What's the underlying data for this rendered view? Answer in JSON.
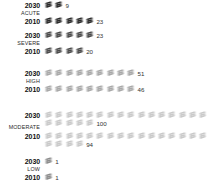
{
  "chart_data": {
    "type": "bar",
    "subtype": "pictogram",
    "title": "",
    "xlabel": "",
    "ylabel": "",
    "icon_unit": 6,
    "icon_name": "document-stack-icon",
    "categories": [
      "ACUTE",
      "SEVERE",
      "HIGH",
      "MODERATE",
      "LOW"
    ],
    "series": [
      {
        "name": "2030",
        "values": [
          9,
          23,
          51,
          100,
          1
        ]
      },
      {
        "name": "2010",
        "values": [
          23,
          20,
          46,
          94,
          1
        ]
      }
    ],
    "groups": [
      {
        "category": "ACUTE",
        "color": "#2b2b2b",
        "rows": [
          {
            "year": "2030",
            "value": 9,
            "icons": 2
          },
          {
            "year": "2010",
            "value": 23,
            "icons": 5
          }
        ]
      },
      {
        "category": "SEVERE",
        "color": "#4a4a4a",
        "rows": [
          {
            "year": "2030",
            "value": 23,
            "icons": 5
          },
          {
            "year": "2010",
            "value": 20,
            "icons": 4
          }
        ]
      },
      {
        "category": "HIGH",
        "color": "#a8a8a8",
        "rows": [
          {
            "year": "2030",
            "value": 51,
            "icons": 9
          },
          {
            "year": "2010",
            "value": 46,
            "icons": 9
          }
        ]
      },
      {
        "category": "MODERATE",
        "color": "#c9c9c9",
        "rows": [
          {
            "year": "2030",
            "value": 100,
            "icons": 21
          },
          {
            "year": "2010",
            "value": 94,
            "icons": 20
          }
        ]
      },
      {
        "category": "LOW",
        "color": "#8c8c8c",
        "rows": [
          {
            "year": "2030",
            "value": 1,
            "icons": 1
          },
          {
            "year": "2010",
            "value": 1,
            "icons": 1
          }
        ]
      }
    ]
  }
}
